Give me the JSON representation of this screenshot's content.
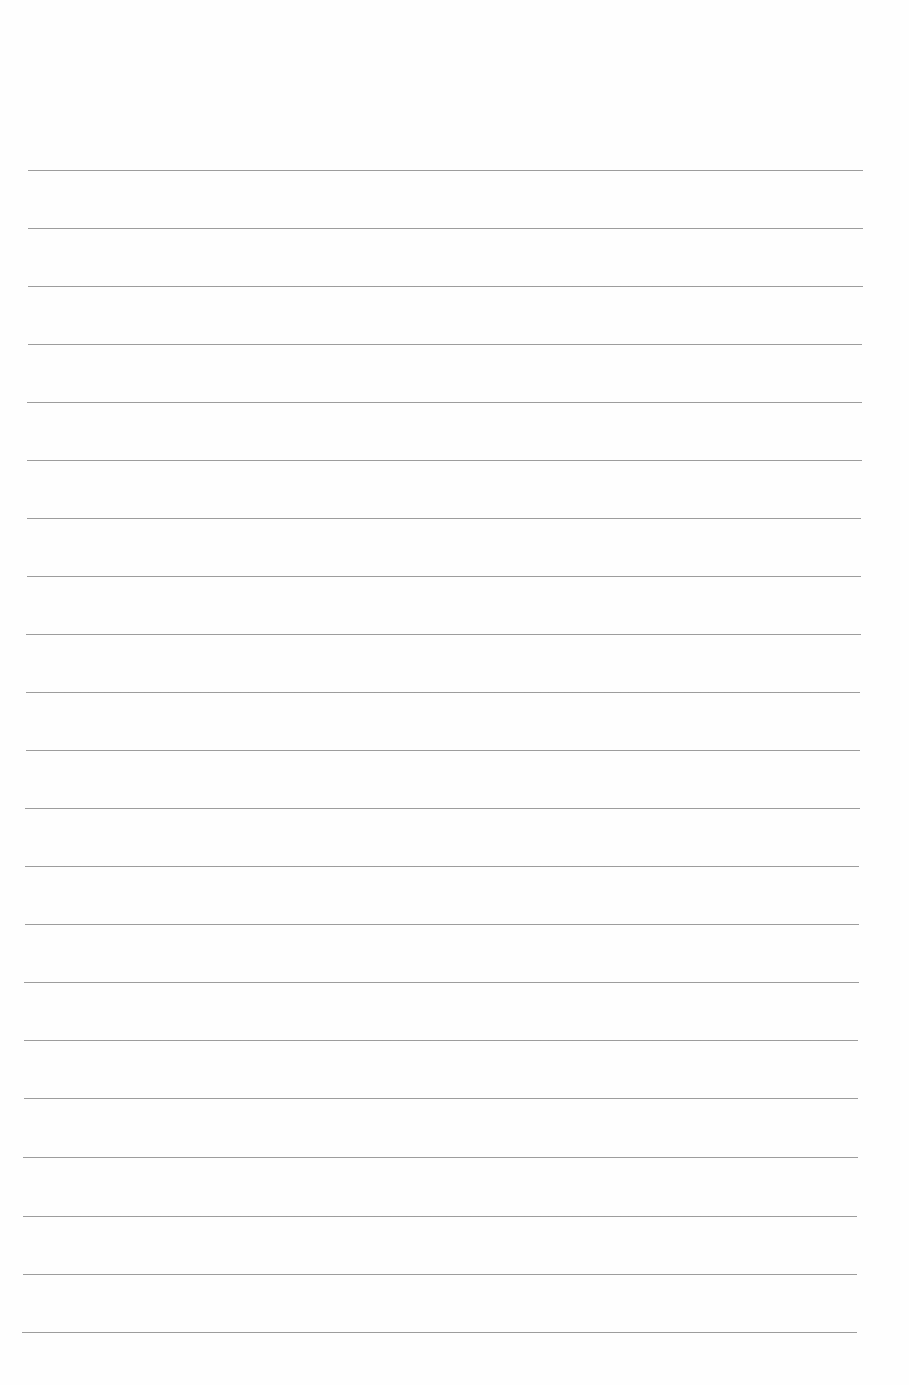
{
  "document": {
    "type": "blank-lined-paper",
    "line_color": "#8e8e8e",
    "background_color": "#fefefe",
    "line_count": 21,
    "lines": [
      {
        "y": 170,
        "x1": 28,
        "x2": 863
      },
      {
        "y": 228,
        "x1": 28,
        "x2": 863
      },
      {
        "y": 286,
        "x1": 28,
        "x2": 863
      },
      {
        "y": 344,
        "x1": 28,
        "x2": 862
      },
      {
        "y": 402,
        "x1": 27,
        "x2": 862
      },
      {
        "y": 460,
        "x1": 27,
        "x2": 862
      },
      {
        "y": 518,
        "x1": 27,
        "x2": 861
      },
      {
        "y": 576,
        "x1": 27,
        "x2": 861
      },
      {
        "y": 634,
        "x1": 26,
        "x2": 861
      },
      {
        "y": 692,
        "x1": 26,
        "x2": 860
      },
      {
        "y": 750,
        "x1": 26,
        "x2": 860
      },
      {
        "y": 808,
        "x1": 25,
        "x2": 860
      },
      {
        "y": 866,
        "x1": 25,
        "x2": 859
      },
      {
        "y": 924,
        "x1": 25,
        "x2": 859
      },
      {
        "y": 982,
        "x1": 24,
        "x2": 859
      },
      {
        "y": 1040,
        "x1": 24,
        "x2": 858
      },
      {
        "y": 1098,
        "x1": 24,
        "x2": 858
      },
      {
        "y": 1157,
        "x1": 23,
        "x2": 858
      },
      {
        "y": 1216,
        "x1": 23,
        "x2": 857
      },
      {
        "y": 1274,
        "x1": 23,
        "x2": 857
      },
      {
        "y": 1332,
        "x1": 22,
        "x2": 857
      }
    ]
  }
}
